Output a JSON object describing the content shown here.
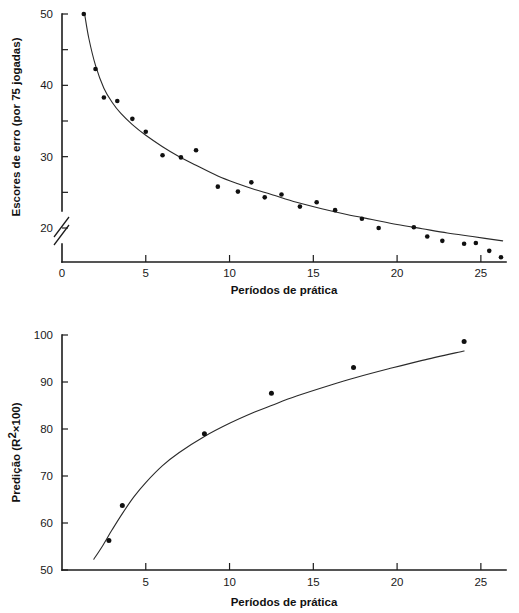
{
  "page": {
    "background_color": "#ffffff",
    "ink_color": "#1a1a1a"
  },
  "chart_data": [
    {
      "id": "error-scores-vs-practice",
      "type": "scatter",
      "title": "",
      "xlabel": "Períodos de prática",
      "ylabel": "Escores de erro (por 75 jogadas)",
      "xlim": [
        0,
        26.5
      ],
      "ylim": [
        15,
        50
      ],
      "xticks": [
        0,
        5,
        10,
        15,
        20,
        25
      ],
      "xtick_labels": [
        "0",
        "5",
        "10",
        "15",
        "20",
        "25"
      ],
      "yticks": [
        20,
        25,
        30,
        35,
        40,
        45,
        50
      ],
      "ytick_labels": [
        "20",
        "",
        "30",
        "",
        "40",
        "",
        "50"
      ],
      "y_axis_break": true,
      "y_axis_break_below": 20,
      "grid": false,
      "legend": "none",
      "marker": "filled-circle",
      "points": [
        {
          "x": 1.3,
          "y": 50.0
        },
        {
          "x": 2.0,
          "y": 42.3
        },
        {
          "x": 2.5,
          "y": 38.3
        },
        {
          "x": 3.3,
          "y": 37.8
        },
        {
          "x": 4.2,
          "y": 35.3
        },
        {
          "x": 5.0,
          "y": 33.5
        },
        {
          "x": 6.0,
          "y": 30.2
        },
        {
          "x": 7.1,
          "y": 29.9
        },
        {
          "x": 8.0,
          "y": 30.9
        },
        {
          "x": 9.3,
          "y": 25.8
        },
        {
          "x": 10.5,
          "y": 25.1
        },
        {
          "x": 11.3,
          "y": 26.4
        },
        {
          "x": 12.1,
          "y": 24.3
        },
        {
          "x": 13.1,
          "y": 24.7
        },
        {
          "x": 14.2,
          "y": 23.0
        },
        {
          "x": 15.2,
          "y": 23.6
        },
        {
          "x": 16.3,
          "y": 22.5
        },
        {
          "x": 17.9,
          "y": 21.3
        },
        {
          "x": 18.9,
          "y": 20.0
        },
        {
          "x": 21.0,
          "y": 20.1
        },
        {
          "x": 21.8,
          "y": 18.8
        },
        {
          "x": 22.7,
          "y": 18.2
        },
        {
          "x": 24.0,
          "y": 17.8
        },
        {
          "x": 24.7,
          "y": 17.9
        },
        {
          "x": 25.5,
          "y": 16.8
        },
        {
          "x": 26.2,
          "y": 15.9
        }
      ],
      "fit_curve": [
        {
          "x": 1.35,
          "y": 50.0
        },
        {
          "x": 1.6,
          "y": 46.6
        },
        {
          "x": 2.0,
          "y": 42.8
        },
        {
          "x": 2.5,
          "y": 39.6
        },
        {
          "x": 3.0,
          "y": 37.6
        },
        {
          "x": 3.5,
          "y": 36.1
        },
        {
          "x": 4.2,
          "y": 34.5
        },
        {
          "x": 5.0,
          "y": 33.0
        },
        {
          "x": 6.0,
          "y": 31.4
        },
        {
          "x": 7.0,
          "y": 30.0
        },
        {
          "x": 8.0,
          "y": 28.8
        },
        {
          "x": 9.3,
          "y": 27.3
        },
        {
          "x": 10.5,
          "y": 26.2
        },
        {
          "x": 11.5,
          "y": 25.4
        },
        {
          "x": 12.5,
          "y": 24.7
        },
        {
          "x": 14.0,
          "y": 23.6
        },
        {
          "x": 15.5,
          "y": 22.7
        },
        {
          "x": 17.0,
          "y": 21.9
        },
        {
          "x": 18.5,
          "y": 21.2
        },
        {
          "x": 20.0,
          "y": 20.5
        },
        {
          "x": 21.5,
          "y": 19.9
        },
        {
          "x": 23.0,
          "y": 19.3
        },
        {
          "x": 24.5,
          "y": 18.8
        },
        {
          "x": 26.3,
          "y": 18.2
        }
      ]
    },
    {
      "id": "prediction-r2-vs-practice",
      "type": "scatter",
      "title": "",
      "xlabel": "Períodos de prática",
      "ylabel": "Predição (R²×100)",
      "ylabel_parts": {
        "prefix": "Predição (R",
        "superscript": "2",
        "middle": "×100)"
      },
      "xlim": [
        0,
        26.5
      ],
      "ylim": [
        50,
        100
      ],
      "xticks": [
        5,
        10,
        15,
        20,
        25
      ],
      "xtick_labels": [
        "5",
        "10",
        "15",
        "20",
        "25"
      ],
      "yticks": [
        50,
        60,
        70,
        80,
        90,
        100
      ],
      "ytick_labels": [
        "50",
        "60",
        "70",
        "80",
        "90",
        "100"
      ],
      "grid": false,
      "legend": "none",
      "marker": "filled-circle",
      "points": [
        {
          "x": 2.8,
          "y": 56.3
        },
        {
          "x": 3.6,
          "y": 63.7
        },
        {
          "x": 8.5,
          "y": 79.0
        },
        {
          "x": 12.5,
          "y": 87.6
        },
        {
          "x": 17.4,
          "y": 93.1
        },
        {
          "x": 24.0,
          "y": 98.6
        }
      ],
      "fit_curve": [
        {
          "x": 1.9,
          "y": 52.3
        },
        {
          "x": 2.4,
          "y": 55.0
        },
        {
          "x": 3.0,
          "y": 58.6
        },
        {
          "x": 3.6,
          "y": 62.0
        },
        {
          "x": 4.3,
          "y": 65.6
        },
        {
          "x": 5.0,
          "y": 68.6
        },
        {
          "x": 6.0,
          "y": 72.2
        },
        {
          "x": 7.0,
          "y": 75.0
        },
        {
          "x": 8.5,
          "y": 78.4
        },
        {
          "x": 10.0,
          "y": 81.2
        },
        {
          "x": 11.5,
          "y": 83.6
        },
        {
          "x": 12.5,
          "y": 85.0
        },
        {
          "x": 14.0,
          "y": 87.0
        },
        {
          "x": 16.0,
          "y": 89.3
        },
        {
          "x": 17.5,
          "y": 90.9
        },
        {
          "x": 19.5,
          "y": 92.8
        },
        {
          "x": 21.5,
          "y": 94.6
        },
        {
          "x": 24.0,
          "y": 96.6
        }
      ]
    }
  ]
}
